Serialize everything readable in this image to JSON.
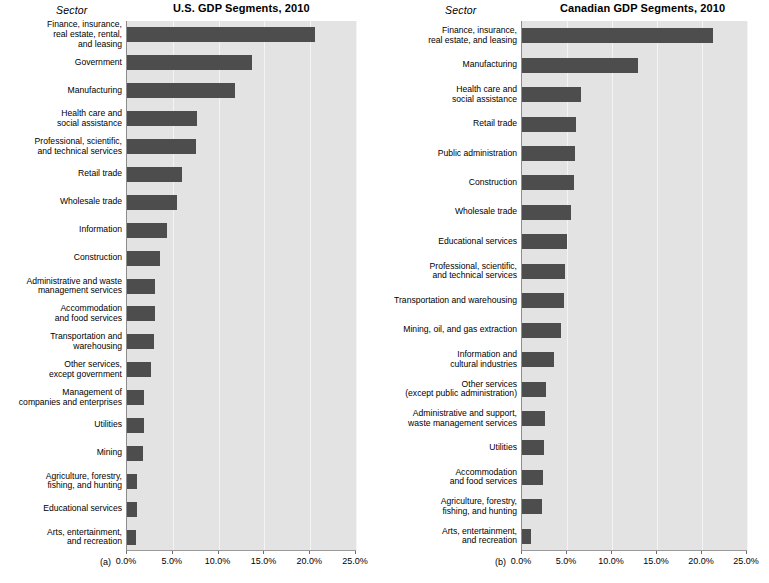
{
  "page": {
    "background": "#ffffff",
    "bar_color": "#4d4d4d",
    "plot_background": "#e3e3e3",
    "gridline_color": "#f4f4f4"
  },
  "panels": [
    {
      "letter": "(a)",
      "sector_header": "Sector",
      "title": "U.S. GDP Segments, 2010"
    },
    {
      "letter": "(b)",
      "sector_header": "Sector",
      "title": "Canadian GDP Segments, 2010"
    }
  ],
  "axis": {
    "ticks": [
      "0.0%",
      "5.0%",
      "10.0%",
      "15.0%",
      "20.0%",
      "25.0%"
    ]
  },
  "chart_data": [
    {
      "type": "bar",
      "orientation": "horizontal",
      "title": "U.S. GDP Segments, 2010",
      "xlabel": "",
      "ylabel": "Sector",
      "xlim": [
        0,
        25
      ],
      "xticks": [
        0,
        5,
        10,
        15,
        20,
        25
      ],
      "xtick_labels": [
        "0.0%",
        "5.0%",
        "10.0%",
        "15.0%",
        "20.0%",
        "25.0%"
      ],
      "grid": true,
      "legend": "none",
      "panel_label": "(a)",
      "categories": [
        "Finance, insurance,\nreal estate, rental,\nand leasing",
        "Government",
        "Manufacturing",
        "Health care and\nsocial assistance",
        "Professional, scientific,\nand technical services",
        "Retail trade",
        "Wholesale trade",
        "Information",
        "Construction",
        "Administrative and waste\nmanagement services",
        "Accommodation\nand food services",
        "Transportation and\nwarehousing",
        "Other services,\nexcept government",
        "Management of\ncompanies and enterprises",
        "Utilities",
        "Mining",
        "Agriculture, forestry,\nfishing, and hunting",
        "Educational services",
        "Arts, entertainment,\nand recreation"
      ],
      "values": [
        20.5,
        13.6,
        11.8,
        7.6,
        7.5,
        6.0,
        5.5,
        4.4,
        3.6,
        3.1,
        3.1,
        3.0,
        2.6,
        1.9,
        1.9,
        1.7,
        1.1,
        1.1,
        1.0
      ]
    },
    {
      "type": "bar",
      "orientation": "horizontal",
      "title": "Canadian GDP Segments, 2010",
      "xlabel": "",
      "ylabel": "Sector",
      "xlim": [
        0,
        25
      ],
      "xticks": [
        0,
        5,
        10,
        15,
        20,
        25
      ],
      "xtick_labels": [
        "0.0%",
        "5.0%",
        "10.0%",
        "15.0%",
        "20.0%",
        "25.0%"
      ],
      "grid": true,
      "legend": "none",
      "panel_label": "(b)",
      "categories": [
        "Finance, insurance,\nreal estate, and leasing",
        "Manufacturing",
        "Health care and\nsocial assistance",
        "Retail trade",
        "Public administration",
        "Construction",
        "Wholesale trade",
        "Educational services",
        "Professional, scientific,\nand technical services",
        "Transportation and warehousing",
        "Mining, oil, and gas extraction",
        "Information and\ncultural industries",
        "Other services\n(except public administration)",
        "Administrative and support,\nwaste management services",
        "Utilities",
        "Accommodation\nand food services",
        "Agriculture, forestry,\nfishing, and hunting",
        "Arts, entertainment,\nand recreation"
      ],
      "values": [
        21.2,
        12.9,
        6.6,
        6.0,
        5.9,
        5.8,
        5.4,
        5.0,
        4.8,
        4.7,
        4.3,
        3.6,
        2.7,
        2.5,
        2.4,
        2.3,
        2.2,
        1.0
      ]
    }
  ]
}
